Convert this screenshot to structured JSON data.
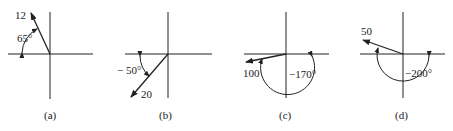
{
  "panels": [
    {
      "id": "a",
      "caption": "(a)",
      "magnitude": "12",
      "angle": "65°",
      "center": [
        50,
        54
      ],
      "tip": [
        31,
        13
      ]
    },
    {
      "id": "b",
      "caption": "(b)",
      "magnitude": "20",
      "angle": "− 50°",
      "center": [
        168,
        54
      ],
      "tip": [
        131,
        97
      ]
    },
    {
      "id": "c",
      "caption": "(c)",
      "magnitude": "100",
      "angle": "−170°",
      "center": [
        286,
        54
      ],
      "tip": [
        246,
        62
      ]
    },
    {
      "id": "d",
      "caption": "(d)",
      "magnitude": "50",
      "angle": "−200°",
      "center": [
        403,
        54
      ],
      "tip": [
        363,
        40
      ]
    }
  ],
  "colors": {
    "ink": "#222222",
    "background": "#ffffff"
  }
}
